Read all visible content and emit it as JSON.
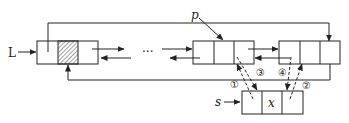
{
  "diagram": {
    "title": "",
    "type": "doubly-linked circular list insertion",
    "labels": {
      "head": "L",
      "pointer_p": "p",
      "new_node": "s",
      "data_x": "x",
      "ellipsis": "···"
    },
    "steps": [
      "①",
      "②",
      "③",
      "④"
    ],
    "colors": {
      "line": "#222222",
      "background": "#ffffff"
    }
  }
}
